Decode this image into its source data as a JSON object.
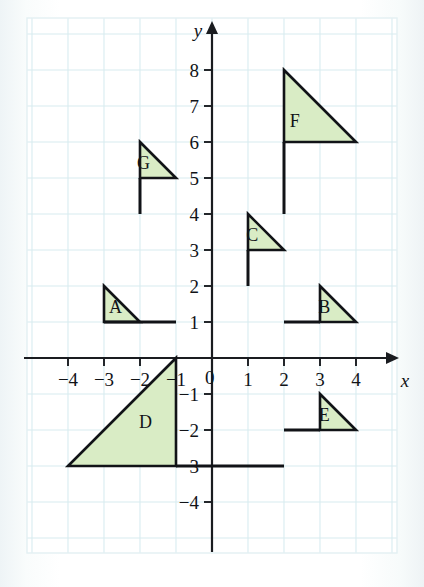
{
  "figure": {
    "type": "coordinate-grid-diagram",
    "background_color": "#ffffff",
    "grid_color": "#d8ecf0",
    "axis_color": "#1a1c20",
    "shape_fill": "#d9ecc5",
    "shape_stroke": "#111317"
  },
  "axes": {
    "x_label": "x",
    "y_label": "y",
    "x_ticks": [
      {
        "value": -4,
        "label": "−4"
      },
      {
        "value": -3,
        "label": "−3"
      },
      {
        "value": -2,
        "label": "−2"
      },
      {
        "value": -1,
        "label": "−1"
      },
      {
        "value": 1,
        "label": "1"
      },
      {
        "value": 2,
        "label": "2"
      },
      {
        "value": 3,
        "label": "3"
      },
      {
        "value": 4,
        "label": "4"
      }
    ],
    "y_ticks": [
      {
        "value": 8,
        "label": "8"
      },
      {
        "value": 7,
        "label": "7"
      },
      {
        "value": 6,
        "label": "6"
      },
      {
        "value": 5,
        "label": "5"
      },
      {
        "value": 4,
        "label": "4"
      },
      {
        "value": 3,
        "label": "3"
      },
      {
        "value": 2,
        "label": "2"
      },
      {
        "value": 1,
        "label": "1"
      },
      {
        "value": -1,
        "label": "−1"
      },
      {
        "value": -2,
        "label": "−2"
      },
      {
        "value": -3,
        "label": "−3"
      },
      {
        "value": -4,
        "label": "−4"
      }
    ],
    "origin_label": "0",
    "x_range": [
      -5.1,
      5.0
    ],
    "y_range": [
      -5.0,
      9.3
    ]
  },
  "chart_data": {
    "type": "scatter",
    "title": "",
    "xlabel": "x",
    "ylabel": "y",
    "xlim": [
      -5.1,
      5.0
    ],
    "ylim": [
      -5.0,
      9.3
    ],
    "grid": true,
    "legend": "none",
    "shapes": [
      {
        "name": "A",
        "label": "A",
        "triangle": [
          [
            -3,
            2
          ],
          [
            -3,
            1
          ],
          [
            -2,
            1
          ]
        ],
        "pole": [
          [
            -3,
            1
          ],
          [
            -1,
            1
          ]
        ],
        "label_at": [
          -2.68,
          1.42
        ]
      },
      {
        "name": "B",
        "label": "B",
        "triangle": [
          [
            3,
            2
          ],
          [
            3,
            1
          ],
          [
            4,
            1
          ]
        ],
        "pole": [
          [
            3,
            1
          ],
          [
            2,
            1
          ]
        ],
        "label_at": [
          3.12,
          1.42
        ]
      },
      {
        "name": "C",
        "label": "C",
        "triangle": [
          [
            1,
            4
          ],
          [
            1,
            3
          ],
          [
            2,
            3
          ]
        ],
        "pole": [
          [
            1,
            3
          ],
          [
            1,
            2
          ]
        ],
        "label_at": [
          1.12,
          3.42
        ]
      },
      {
        "name": "D",
        "label": "D",
        "triangle": [
          [
            -1,
            0
          ],
          [
            -1,
            -3
          ],
          [
            -4,
            -3
          ]
        ],
        "pole": [
          [
            -1,
            -3
          ],
          [
            2,
            -3
          ]
        ],
        "label_at": [
          -1.85,
          -1.78
        ]
      },
      {
        "name": "E",
        "label": "E",
        "triangle": [
          [
            3,
            -1
          ],
          [
            3,
            -2
          ],
          [
            4,
            -2
          ]
        ],
        "pole": [
          [
            3,
            -2
          ],
          [
            2,
            -2
          ]
        ],
        "label_at": [
          3.12,
          -1.58
        ]
      },
      {
        "name": "F",
        "label": "F",
        "triangle": [
          [
            2,
            8
          ],
          [
            2,
            6
          ],
          [
            4,
            6
          ]
        ],
        "pole": [
          [
            2,
            6
          ],
          [
            2,
            4
          ]
        ],
        "label_at": [
          2.3,
          6.58
        ]
      },
      {
        "name": "G",
        "label": "G",
        "triangle": [
          [
            -2,
            6
          ],
          [
            -2,
            5
          ],
          [
            -1,
            5
          ]
        ],
        "pole": [
          [
            -2,
            5
          ],
          [
            -2,
            4
          ]
        ],
        "label_at": [
          -1.9,
          5.42
        ]
      }
    ]
  }
}
